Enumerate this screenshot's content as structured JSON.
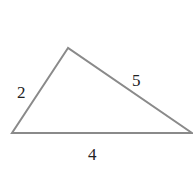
{
  "diagram": {
    "type": "triangle",
    "stroke_color": "#8a8a8a",
    "vertices": {
      "top": [
        68,
        48
      ],
      "left": [
        12,
        133
      ],
      "right": [
        192,
        133
      ]
    },
    "sides": [
      {
        "name": "left-side",
        "label": "2"
      },
      {
        "name": "right-side",
        "label": "5"
      },
      {
        "name": "base",
        "label": "4"
      }
    ]
  }
}
